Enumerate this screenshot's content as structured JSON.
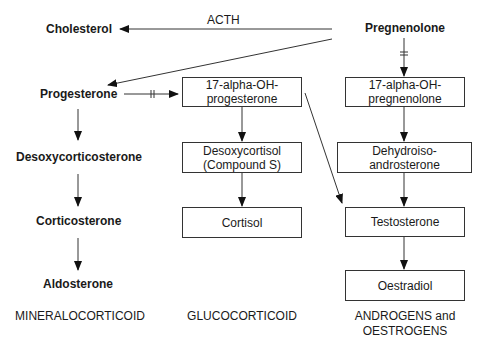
{
  "diagram": {
    "edge_label_acth": "ACTH",
    "nodes": {
      "cholesterol": "Cholesterol",
      "pregnenolone": "Pregnenolone",
      "progesterone": "Progesterone",
      "desoxycorticosterone": "Desoxycorticosterone",
      "corticosterone": "Corticosterone",
      "aldosterone": "Aldosterone",
      "oh_progesterone": {
        "line1": "17-alpha-OH-",
        "line2": "progesterone"
      },
      "desoxycortisol": {
        "line1": "Desoxycortisol",
        "line2": "(Compound S)"
      },
      "cortisol": "Cortisol",
      "oh_pregnenolone": {
        "line1": "17-alpha-OH-",
        "line2": "pregnenolone"
      },
      "dhea": {
        "line1": "Dehydroiso-",
        "line2": "androsterone"
      },
      "testosterone": "Testosterone",
      "oestradiol": "Oestradiol"
    },
    "categories": {
      "mineralocorticoid": "MINERALOCORTICOID",
      "glucocorticoid": "GLUCOCORTICOID",
      "androgens_line1": "ANDROGENS and",
      "androgens_line2": "OESTROGENS"
    },
    "edges": [
      {
        "from": "Pregnenolone",
        "to": "Cholesterol",
        "label": "ACTH"
      },
      {
        "from": "Pregnenolone",
        "to": "Progesterone"
      },
      {
        "from": "Progesterone",
        "to": "17-alpha-OH-progesterone",
        "inhibited": true
      },
      {
        "from": "Pregnenolone",
        "to": "17-alpha-OH-pregnenolone",
        "inhibited": true
      },
      {
        "from": "Progesterone",
        "to": "Desoxycorticosterone"
      },
      {
        "from": "Desoxycorticosterone",
        "to": "Corticosterone"
      },
      {
        "from": "Corticosterone",
        "to": "Aldosterone"
      },
      {
        "from": "17-alpha-OH-progesterone",
        "to": "Desoxycortisol (Compound S)"
      },
      {
        "from": "Desoxycortisol (Compound S)",
        "to": "Cortisol"
      },
      {
        "from": "17-alpha-OH-progesterone",
        "to": "Testosterone"
      },
      {
        "from": "17-alpha-OH-pregnenolone",
        "to": "Dehydroiso-androsterone"
      },
      {
        "from": "Dehydroiso-androsterone",
        "to": "Testosterone"
      },
      {
        "from": "Testosterone",
        "to": "Oestradiol"
      }
    ]
  }
}
